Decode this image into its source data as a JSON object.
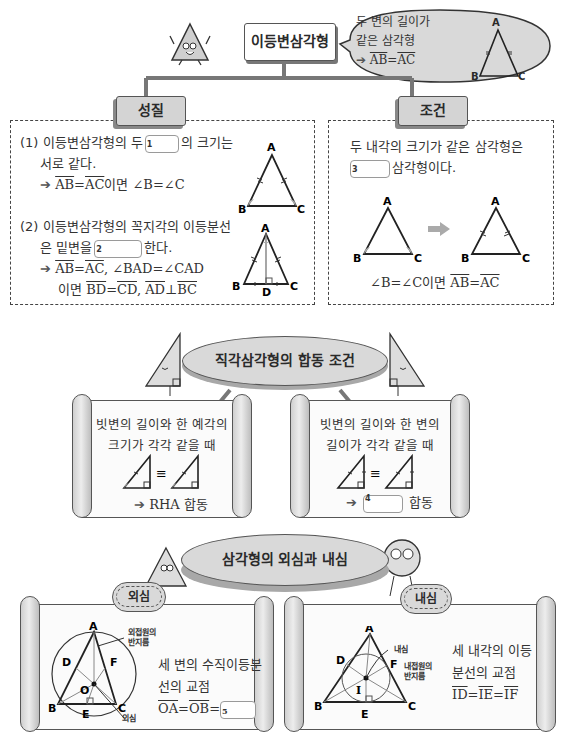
{
  "isosceles": {
    "title": "이등변삼각형",
    "definition": {
      "line1": "두 변의 길이가",
      "line2": "같은 삼각형",
      "arrow": "➔",
      "formula_left": "AB",
      "formula_eq": "=",
      "formula_right": "AC",
      "labels": {
        "a": "A",
        "b": "B",
        "c": "C"
      }
    },
    "properties": {
      "tab": "성질",
      "item1": {
        "prefix": "(1) 이등변삼각형의 두",
        "blank_num": "1",
        "suffix": "의 크기는",
        "line2": "서로 같다.",
        "arrow": "➔",
        "f1": "AB",
        "eq": "=",
        "f2": "AC",
        "rest": "이면 ∠B=∠C",
        "labels": {
          "a": "A",
          "b": "B",
          "c": "C"
        }
      },
      "item2": {
        "line1": "(2) 이등변삼각형의 꼭지각의 이등분선",
        "prefix2": "은 밑변을",
        "blank_num": "2",
        "suffix2": "한다.",
        "arrow": "➔",
        "f1": "AB",
        "eq": "=",
        "f2": "AC",
        "rest3": ", ∠BAD=∠CAD",
        "l4_prefix": "이면",
        "f3": "BD",
        "f4": "CD",
        "comma": ",",
        "f5": "AD",
        "perp": "⊥",
        "f6": "BC",
        "labels": {
          "a": "A",
          "b": "B",
          "c": "C",
          "d": "D"
        }
      }
    },
    "condition": {
      "tab": "조건",
      "line1": "두 내각의 크기가 같은 삼각형은",
      "blank_num": "3",
      "suffix": "삼각형이다.",
      "formula_prefix": "∠B=∠C이면",
      "f1": "AB",
      "eq": "=",
      "f2": "AC",
      "labels": {
        "a": "A",
        "b": "B",
        "c": "C"
      }
    }
  },
  "right_congruence": {
    "title": "직각삼각형의 합동 조건",
    "left": {
      "line1": "빗변의 길이와 한 예각의",
      "line2": "크기가 각각 같을 때",
      "equiv": "≡",
      "arrow": "➔",
      "result": "RHA 합동"
    },
    "right": {
      "line1": "빗변의 길이와 한 변의",
      "line2": "길이가 각각 같을 때",
      "equiv": "≡",
      "arrow": "➔",
      "blank_num": "4",
      "suffix": "합동"
    }
  },
  "centers": {
    "title": "삼각형의 외심과 내심",
    "circumcenter": {
      "tab": "외심",
      "line1": "세 변의 수직이등분",
      "line2": "선의 교점",
      "f1": "OA",
      "eq": "=",
      "f2": "OB",
      "eq2": "=",
      "blank_num": "5",
      "annot_radius": "외접원의\n반지름",
      "annot_radius_1": "외접원의",
      "annot_radius_2": "반지름",
      "annot_center": "외심",
      "labels": {
        "a": "A",
        "b": "B",
        "c": "C",
        "d": "D",
        "e": "E",
        "f": "F",
        "o": "O"
      }
    },
    "incenter": {
      "tab": "내심",
      "line1": "세 내각의 이등",
      "line2": "분선의 교점",
      "f1": "ID",
      "eq": "=",
      "f2": "IE",
      "eq2": "=",
      "f3": "IF",
      "annot_center": "내심",
      "annot_radius_1": "내접원의",
      "annot_radius_2": "반지름",
      "labels": {
        "a": "A",
        "b": "B",
        "c": "C",
        "d": "D",
        "e": "E",
        "f": "F",
        "i": "I"
      }
    }
  },
  "colors": {
    "line": "#333333",
    "fill_gray": "#d4d4d4",
    "paper": "#fbfbfb",
    "arrow": "#555555"
  }
}
